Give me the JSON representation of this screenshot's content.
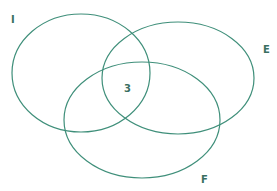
{
  "diagram": {
    "type": "venn",
    "stroke_color": "#3f8f7a",
    "label_color": "#3a6f61",
    "sets": [
      {
        "id": "I",
        "label": "I",
        "cx": 81,
        "cy": 73,
        "rx": 69,
        "ry": 59,
        "label_x": 11,
        "label_y": 23
      },
      {
        "id": "E",
        "label": "E",
        "cx": 178,
        "cy": 78,
        "rx": 76,
        "ry": 56,
        "label_x": 263,
        "label_y": 53
      },
      {
        "id": "F",
        "label": "F",
        "cx": 142,
        "cy": 120,
        "rx": 78,
        "ry": 58,
        "label_x": 201,
        "label_y": 183
      }
    ],
    "region_values": [
      {
        "region": "I∩E∩F",
        "value": "3",
        "x": 124,
        "y": 92
      }
    ]
  }
}
